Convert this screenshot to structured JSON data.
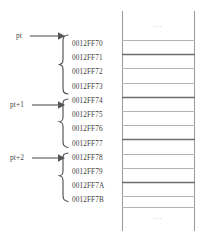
{
  "figure": {
    "type": "memory-layout-diagram",
    "colors": {
      "text": "#3d3d3d",
      "label_text": "#4a4a4a",
      "line": "#8a8a8a",
      "line_strong": "#6e6e6e",
      "line_light": "#b4b4b4",
      "ellipsis": "#b9b9b9",
      "background": "#ffffff"
    }
  },
  "pointers": [
    {
      "label": "pt",
      "y": 36,
      "arrow_y": 36,
      "brace_top": 34,
      "brace_bottom": 95
    },
    {
      "label": "pt+1",
      "y": 105,
      "arrow_y": 105,
      "brace_top": 99,
      "brace_bottom": 152
    },
    {
      "label": "pt+2",
      "y": 158,
      "arrow_y": 158,
      "brace_top": 155,
      "brace_bottom": 209
    }
  ],
  "addresses": [
    {
      "text": "0012FF70",
      "y": 45
    },
    {
      "text": "0012FF71",
      "y": 59
    },
    {
      "text": "0012FF72",
      "y": 73
    },
    {
      "text": "0012FF73",
      "y": 88
    },
    {
      "text": "0012FF74",
      "y": 102
    },
    {
      "text": "0012FF75",
      "y": 116
    },
    {
      "text": "0012FF76",
      "y": 130
    },
    {
      "text": "0012FF77",
      "y": 145
    },
    {
      "text": "0012FF78",
      "y": 159
    },
    {
      "text": "0012FF79",
      "y": 173
    },
    {
      "text": "0012FF7A",
      "y": 187
    },
    {
      "text": "0012FF7B",
      "y": 201
    }
  ],
  "memory_column": {
    "left": 122,
    "right": 195,
    "top": 11,
    "bottom": 231,
    "ellipsis_top": {
      "text": "...",
      "y": 24
    },
    "ellipsis_bottom": {
      "text": "...",
      "y": 216
    },
    "row_dividers": [
      {
        "y": 40,
        "weight": "light"
      },
      {
        "y": 54,
        "weight": "strong"
      },
      {
        "y": 68,
        "weight": "light"
      },
      {
        "y": 83,
        "weight": "light"
      },
      {
        "y": 97,
        "weight": "strong"
      },
      {
        "y": 111,
        "weight": "light"
      },
      {
        "y": 125,
        "weight": "light"
      },
      {
        "y": 139,
        "weight": "strong"
      },
      {
        "y": 154,
        "weight": "light"
      },
      {
        "y": 168,
        "weight": "light"
      },
      {
        "y": 182,
        "weight": "strong"
      },
      {
        "y": 196,
        "weight": "light"
      },
      {
        "y": 207,
        "weight": "light"
      }
    ]
  }
}
